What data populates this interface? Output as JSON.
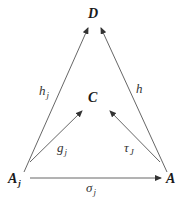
{
  "diagram": {
    "type": "commutative-diagram",
    "nodes": {
      "D": {
        "label": "D"
      },
      "C": {
        "label": "C"
      },
      "Aj": {
        "label": "A",
        "subscript": "j"
      },
      "A": {
        "label": "A"
      }
    },
    "edges": {
      "hj": {
        "from": "Aj",
        "to": "D",
        "label": "h",
        "subscript": "j"
      },
      "h": {
        "from": "A",
        "to": "D",
        "label": "h"
      },
      "gj": {
        "from": "Aj",
        "to": "C",
        "label": "g",
        "subscript": "j"
      },
      "tauJ": {
        "from": "A",
        "to": "C",
        "label": "τ",
        "subscript": "J"
      },
      "sigmaj": {
        "from": "Aj",
        "to": "A",
        "label": "σ",
        "subscript": "j"
      }
    },
    "colors": {
      "line": "#555555",
      "text": "#1a1a1a"
    }
  }
}
